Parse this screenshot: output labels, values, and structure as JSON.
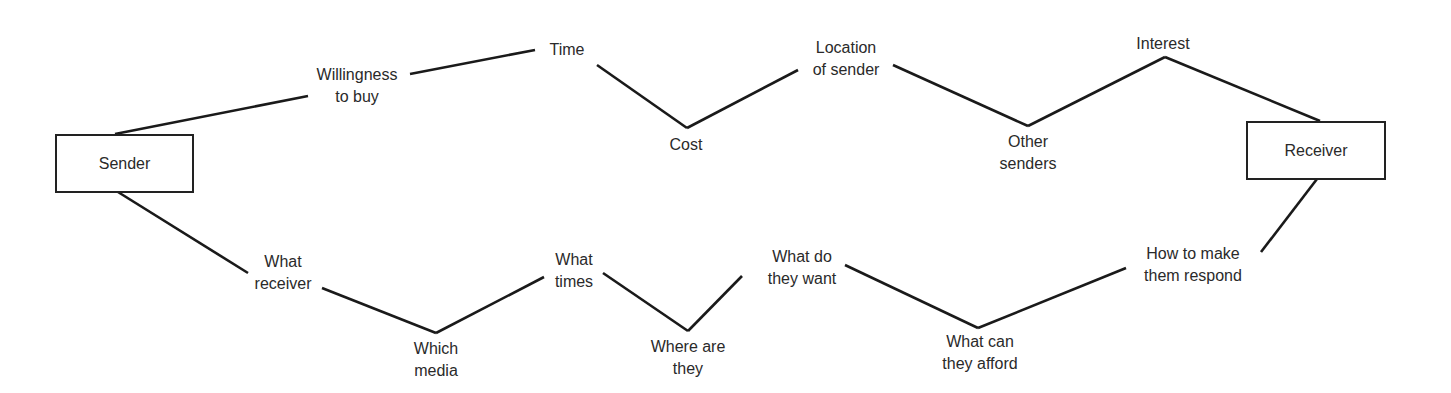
{
  "diagram": {
    "type": "communication-path",
    "colors": {
      "line": "#1a1a1a",
      "text": "#2a2a2a",
      "background": "#ffffff"
    },
    "nodes": {
      "sender": "Sender",
      "receiver": "Receiver"
    },
    "top_path": {
      "labels": [
        {
          "line1": "Willingness",
          "line2": "to buy"
        },
        {
          "line1": "Time"
        },
        {
          "line1": "Cost"
        },
        {
          "line1": "Location",
          "line2": "of sender"
        },
        {
          "line1": "Other",
          "line2": "senders"
        },
        {
          "line1": "Interest"
        }
      ]
    },
    "bottom_path": {
      "labels": [
        {
          "line1": "What",
          "line2": "receiver"
        },
        {
          "line1": "Which",
          "line2": "media"
        },
        {
          "line1": "What",
          "line2": "times"
        },
        {
          "line1": "Where are",
          "line2": "they"
        },
        {
          "line1": "What do",
          "line2": "they want"
        },
        {
          "line1": "What can",
          "line2": "they afford"
        },
        {
          "line1": "How to make",
          "line2": "them respond"
        }
      ]
    }
  }
}
